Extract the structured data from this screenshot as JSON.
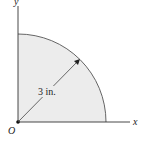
{
  "diagram": {
    "type": "quarter-circle-area",
    "axes": {
      "x_label": "x",
      "y_label": "y",
      "origin_label": "O"
    },
    "dimension": {
      "label": "3 in.",
      "meaning": "radius"
    },
    "colors": {
      "fill": "#ececec",
      "stroke": "#555555",
      "axis": "#333333"
    }
  }
}
